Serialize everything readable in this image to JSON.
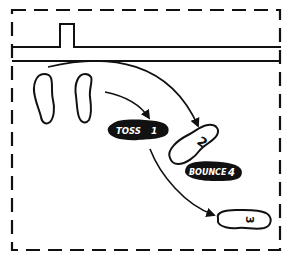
{
  "diagram": {
    "colors": {
      "ink": "#111111",
      "background": "#ffffff",
      "label_text": "#ffffff"
    },
    "court": {
      "border_style": "dashed",
      "net_line": "double solid line with raised post"
    },
    "footprints": [
      {
        "id": "start-left",
        "label": ""
      },
      {
        "id": "start-right",
        "label": ""
      },
      {
        "id": "step-2",
        "label": "2"
      },
      {
        "id": "step-3",
        "label": "3"
      }
    ],
    "markers": [
      {
        "id": "toss",
        "text": "TOSS",
        "number": "1"
      },
      {
        "id": "bounce",
        "text": "BOUNCE",
        "number": "4"
      }
    ],
    "arrows": [
      {
        "from": "start",
        "to": "toss"
      },
      {
        "from": "start",
        "to": "step-2"
      },
      {
        "from": "toss",
        "to": "step-3"
      }
    ]
  }
}
